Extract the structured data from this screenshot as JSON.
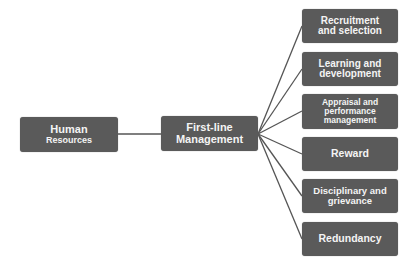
{
  "diagram": {
    "type": "tree",
    "colors": {
      "box_fill": "#5a5a5a",
      "box_text": "#f4f4f4",
      "connector": "#555555",
      "background": "#ffffff"
    },
    "root": {
      "id": "hr",
      "line1": "Human",
      "line2": "Resources"
    },
    "middle": {
      "id": "flm",
      "line1": "First-line",
      "line2": "Management"
    },
    "children": [
      {
        "id": "recruitment",
        "line1": "Recruitment",
        "line2": "and selection",
        "line3": ""
      },
      {
        "id": "learning",
        "line1": "Learning and",
        "line2": "development",
        "line3": ""
      },
      {
        "id": "appraisal",
        "line1": "Appraisal and",
        "line2": "performance",
        "line3": "management"
      },
      {
        "id": "reward",
        "line1": "Reward",
        "line2": "",
        "line3": ""
      },
      {
        "id": "disciplinary",
        "line1": "Disciplinary and",
        "line2": "grievance",
        "line3": ""
      },
      {
        "id": "redundancy",
        "line1": "Redundancy",
        "line2": "",
        "line3": ""
      }
    ],
    "edges": [
      [
        "hr",
        "flm"
      ],
      [
        "flm",
        "recruitment"
      ],
      [
        "flm",
        "learning"
      ],
      [
        "flm",
        "appraisal"
      ],
      [
        "flm",
        "reward"
      ],
      [
        "flm",
        "disciplinary"
      ],
      [
        "flm",
        "redundancy"
      ]
    ]
  }
}
